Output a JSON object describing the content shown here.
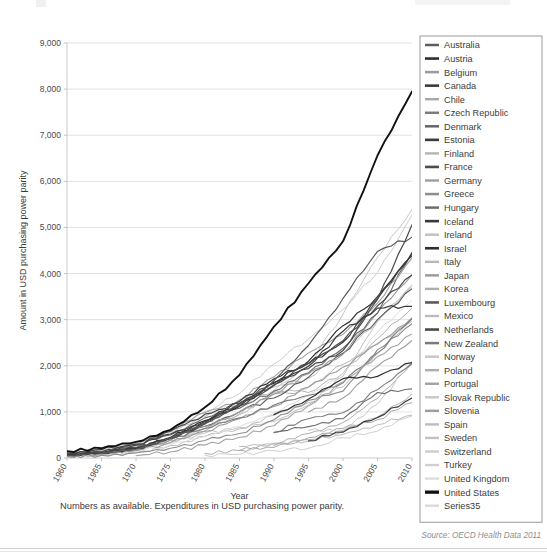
{
  "figure": {
    "footnote": "Numbers as available. Expenditures in USD purchasing power parity.",
    "source": "Source: OECD Health Data 2011"
  },
  "chart_data": {
    "type": "line",
    "title": "",
    "xlabel": "Year",
    "ylabel": "Amount in USD purchasing power parity",
    "xlim": [
      1960,
      2010
    ],
    "ylim": [
      0,
      9000
    ],
    "xticks": [
      1960,
      1965,
      1970,
      1975,
      1980,
      1985,
      1990,
      1995,
      2000,
      2005,
      2010
    ],
    "yticks": [
      0,
      1000,
      2000,
      3000,
      4000,
      5000,
      6000,
      7000,
      8000,
      9000
    ],
    "ytick_labels": [
      "0",
      "1,000",
      "2,000",
      "3,000",
      "4,000",
      "5,000",
      "6,000",
      "7,000",
      "8,000",
      "9,000"
    ],
    "grid": "horizontal",
    "legend_position": "right",
    "x": [
      1960,
      1965,
      1970,
      1975,
      1980,
      1985,
      1990,
      1995,
      2000,
      2005,
      2010
    ],
    "series": [
      {
        "name": "Australia",
        "color": "#5d5d5d",
        "width": 1.1,
        "values": [
          95,
          140,
          230,
          430,
          690,
          1000,
          1300,
          1750,
          2270,
          3000,
          3670
        ]
      },
      {
        "name": "Austria",
        "color": "#2e2e2e",
        "width": 1.2,
        "values": [
          70,
          120,
          210,
          440,
          810,
          1120,
          1640,
          2100,
          2870,
          3500,
          4390
        ]
      },
      {
        "name": "Belgium",
        "color": "#9a9a9a",
        "width": 1.1,
        "values": [
          55,
          100,
          180,
          390,
          690,
          1000,
          1390,
          1830,
          2250,
          3150,
          3970
        ]
      },
      {
        "name": "Canada",
        "color": "#3c3c3c",
        "width": 1.2,
        "values": [
          110,
          180,
          300,
          520,
          790,
          1230,
          1720,
          2050,
          2510,
          3450,
          4440
        ]
      },
      {
        "name": "Chile",
        "color": "#a8a8a8",
        "width": 1.0,
        "values": [
          0,
          0,
          0,
          0,
          0,
          170,
          230,
          440,
          640,
          830,
          1200
        ]
      },
      {
        "name": "Czech Republic",
        "color": "#7c7c7c",
        "width": 1.1,
        "values": [
          0,
          0,
          0,
          0,
          0,
          0,
          560,
          850,
          980,
          1480,
          2050
        ]
      },
      {
        "name": "Denmark",
        "color": "#666666",
        "width": 1.1,
        "values": [
          0,
          0,
          280,
          500,
          870,
          1080,
          1450,
          1850,
          2380,
          3140,
          4460
        ]
      },
      {
        "name": "Estonia",
        "color": "#3a3a3a",
        "width": 1.2,
        "values": [
          0,
          0,
          0,
          0,
          0,
          0,
          0,
          370,
          560,
          880,
          1300
        ]
      },
      {
        "name": "Finland",
        "color": "#b4b4b4",
        "width": 1.0,
        "values": [
          55,
          95,
          180,
          380,
          590,
          940,
          1420,
          1420,
          1840,
          2590,
          3250
        ]
      },
      {
        "name": "France",
        "color": "#4c4c4c",
        "width": 1.2,
        "values": [
          65,
          110,
          210,
          420,
          740,
          1130,
          1570,
          2050,
          2540,
          3300,
          3970
        ]
      },
      {
        "name": "Germany",
        "color": "#a0a0a0",
        "width": 1.1,
        "values": [
          80,
          140,
          270,
          610,
          980,
          1260,
          1760,
          2280,
          2680,
          3360,
          4340
        ]
      },
      {
        "name": "Greece",
        "color": "#8e8e8e",
        "width": 1.1,
        "values": [
          35,
          60,
          110,
          210,
          380,
          530,
          830,
          1250,
          1450,
          2350,
          2910
        ]
      },
      {
        "name": "Hungary",
        "color": "#6e6e6e",
        "width": 1.1,
        "values": [
          0,
          0,
          0,
          0,
          0,
          0,
          550,
          680,
          850,
          1420,
          1500
        ]
      },
      {
        "name": "Iceland",
        "color": "#3a3a3a",
        "width": 1.2,
        "values": [
          60,
          110,
          210,
          450,
          760,
          1180,
          1620,
          1990,
          2750,
          3250,
          3290
        ]
      },
      {
        "name": "Ireland",
        "color": "#c0c0c0",
        "width": 1.0,
        "values": [
          45,
          80,
          160,
          340,
          540,
          660,
          790,
          1150,
          1770,
          2970,
          3720
        ]
      },
      {
        "name": "Israel",
        "color": "#2f2f2f",
        "width": 1.2,
        "values": [
          0,
          0,
          0,
          0,
          0,
          0,
          940,
          1280,
          1720,
          1770,
          2070
        ]
      },
      {
        "name": "Italy",
        "color": "#b8b8b8",
        "width": 1.0,
        "values": [
          50,
          95,
          200,
          380,
          650,
          960,
          1390,
          1530,
          2030,
          2490,
          2960
        ]
      },
      {
        "name": "Japan",
        "color": "#9c9c9c",
        "width": 1.1,
        "values": [
          30,
          75,
          160,
          330,
          580,
          850,
          1120,
          1540,
          1970,
          2470,
          3040
        ]
      },
      {
        "name": "Korea",
        "color": "#adadad",
        "width": 1.0,
        "values": [
          0,
          0,
          0,
          0,
          100,
          160,
          320,
          530,
          770,
          1290,
          2040
        ]
      },
      {
        "name": "Luxembourg",
        "color": "#5a5a5a",
        "width": 1.2,
        "values": [
          55,
          100,
          190,
          430,
          760,
          1150,
          1680,
          2440,
          3460,
          4480,
          4790
        ]
      },
      {
        "name": "Mexico",
        "color": "#bcbcbc",
        "width": 1.0,
        "values": [
          0,
          0,
          0,
          0,
          0,
          250,
          300,
          370,
          510,
          720,
          930
        ]
      },
      {
        "name": "Netherlands",
        "color": "#4a4a4a",
        "width": 1.2,
        "values": [
          70,
          130,
          280,
          580,
          950,
          1190,
          1590,
          1940,
          2330,
          3440,
          5060
        ]
      },
      {
        "name": "New Zealand",
        "color": "#7a7a7a",
        "width": 1.1,
        "values": [
          85,
          135,
          220,
          420,
          640,
          870,
          1150,
          1360,
          1630,
          2280,
          3020
        ]
      },
      {
        "name": "Norway",
        "color": "#c6c6c6",
        "width": 1.0,
        "values": [
          50,
          95,
          180,
          440,
          800,
          1140,
          1470,
          2000,
          3120,
          4350,
          5390
        ]
      },
      {
        "name": "Poland",
        "color": "#b0b0b0",
        "width": 1.0,
        "values": [
          0,
          0,
          0,
          0,
          0,
          0,
          270,
          400,
          580,
          880,
          1390
        ]
      },
      {
        "name": "Portugal",
        "color": "#a4a4a4",
        "width": 1.1,
        "values": [
          0,
          0,
          50,
          130,
          280,
          450,
          700,
          1130,
          1650,
          2200,
          2690
        ]
      },
      {
        "name": "Slovak Republic",
        "color": "#c8c8c8",
        "width": 1.0,
        "values": [
          0,
          0,
          0,
          0,
          0,
          0,
          0,
          600,
          600,
          1170,
          2100
        ]
      },
      {
        "name": "Slovenia",
        "color": "#9e9e9e",
        "width": 1.1,
        "values": [
          0,
          0,
          0,
          0,
          0,
          0,
          0,
          1000,
          1300,
          1990,
          2550
        ]
      },
      {
        "name": "Spain",
        "color": "#bdbdbd",
        "width": 1.0,
        "values": [
          25,
          55,
          120,
          270,
          470,
          630,
          930,
          1200,
          1540,
          2270,
          3030
        ]
      },
      {
        "name": "Sweden",
        "color": "#c2c2c2",
        "width": 1.0,
        "values": [
          90,
          180,
          320,
          560,
          900,
          1180,
          1540,
          1730,
          2280,
          2960,
          3760
        ]
      },
      {
        "name": "Switzerland",
        "color": "#cccccc",
        "width": 1.0,
        "values": [
          90,
          160,
          300,
          610,
          1010,
          1400,
          2040,
          2580,
          3220,
          4020,
          5270
        ]
      },
      {
        "name": "Turkey",
        "color": "#d0d0d0",
        "width": 1.0,
        "values": [
          0,
          0,
          0,
          0,
          60,
          80,
          160,
          210,
          440,
          580,
          910
        ]
      },
      {
        "name": "United Kingdom",
        "color": "#dcdcdc",
        "width": 1.0,
        "values": [
          50,
          85,
          150,
          290,
          470,
          680,
          970,
          1350,
          1830,
          2720,
          3430
        ]
      },
      {
        "name": "United States",
        "color": "#111111",
        "width": 1.9,
        "values": [
          148,
          210,
          350,
          610,
          1100,
          1800,
          2850,
          3790,
          4700,
          6560,
          7950
        ]
      },
      {
        "name": "Series35",
        "color": "#d8d8d8",
        "width": 1.0,
        "values": [
          0,
          0,
          0,
          0,
          0,
          0,
          0,
          0,
          0,
          0,
          0
        ]
      }
    ]
  }
}
